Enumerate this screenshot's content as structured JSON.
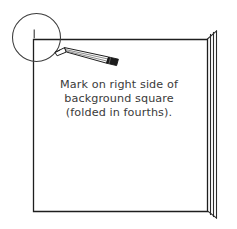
{
  "figure": {
    "background_color": "#ffffff",
    "ink_color": "#222222",
    "text_color": "#3a3a3a",
    "width": 237,
    "height": 229
  },
  "caption": {
    "line1": "Mark on right side of",
    "line2": "background square",
    "line3": "(folded in fourths)."
  },
  "elements": {
    "background_square_name": "background-square",
    "folded_layers_name": "folded-paper-layers",
    "magnifier_name": "magnifier-circle",
    "tick_mark_name": "pencil-tick-mark",
    "pencil_name": "pencil"
  }
}
